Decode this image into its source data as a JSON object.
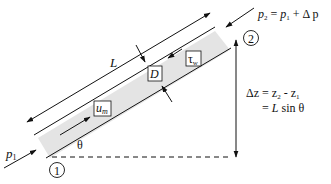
{
  "diagram": {
    "labels": {
      "length": "L",
      "diameter": "D",
      "wall_shear": "τ",
      "wall_shear_sub": "w",
      "mean_velocity": "u",
      "mean_velocity_sub": "m",
      "angle": "θ",
      "inlet_pressure": "p",
      "inlet_pressure_sub": "1",
      "outlet_eq_p": "p",
      "outlet_eq_p_sub": "2",
      "outlet_eq_rhs_p": "p",
      "outlet_eq_rhs_sub": "1",
      "outlet_eq_rhs_rest": "+ Δ p",
      "outlet_eq_equals": "=",
      "station_1": "1",
      "station_2": "2",
      "dz_line1_lhs": "Δz = z",
      "dz_line1_sub2": "2",
      "dz_line1_mid": " - z",
      "dz_line1_sub1": "1",
      "dz_line2_eq": "= ",
      "dz_line2_L": "L",
      "dz_line2_rest": " sin θ"
    },
    "colors": {
      "pipe_fill": "#e4e4e4",
      "line": "#111111",
      "background": "#ffffff"
    }
  }
}
